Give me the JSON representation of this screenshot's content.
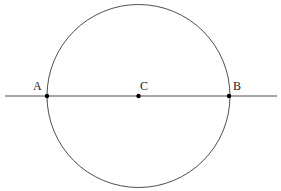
{
  "figure": {
    "background_color": "#ffffff",
    "stroke_color": "#3a3a3a",
    "point_color": "#000000",
    "label_color": "#1a1a1a",
    "width": 281,
    "height": 191
  },
  "circle": {
    "name": "main-circle",
    "center_x": 138.5,
    "center_y": 96,
    "radius": 91.5,
    "stroke_width": 0.9,
    "fill": "none"
  },
  "line": {
    "name": "diameter-line",
    "x1": 5,
    "y1": 96,
    "x2": 277,
    "y2": 96,
    "stroke_width": 0.9
  },
  "points": [
    {
      "id": "A",
      "label": "A",
      "cx": 47,
      "cy": 96,
      "r": 2.2,
      "label_x": 33,
      "label_y": 80,
      "role": "left-intersection"
    },
    {
      "id": "C",
      "label": "C",
      "cx": 138.5,
      "cy": 96,
      "r": 2.2,
      "label_x": 140,
      "label_y": 80,
      "role": "center"
    },
    {
      "id": "B",
      "label": "B",
      "cx": 229,
      "cy": 96,
      "r": 2.2,
      "label_x": 233,
      "label_y": 80,
      "role": "right-intersection"
    }
  ]
}
